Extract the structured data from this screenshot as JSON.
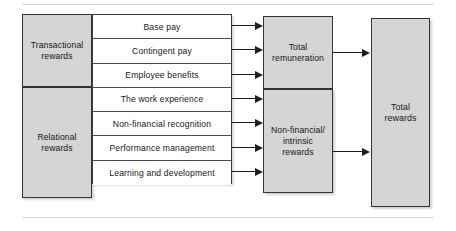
{
  "diagram": {
    "colors": {
      "box_fill": "#d5d5d5",
      "box_border": "#33333a",
      "row_fill": "#ffffff",
      "line": "#1b1b20",
      "background": "#ffffff"
    },
    "categories": [
      {
        "id": "transactional",
        "label": "Transactional\nrewards"
      },
      {
        "id": "relational",
        "label": "Relational\nrewards"
      }
    ],
    "components": [
      {
        "label": "Base pay",
        "category": "transactional",
        "feeds": "total-remuneration"
      },
      {
        "label": "Contingent pay",
        "category": "transactional",
        "feeds": "total-remuneration"
      },
      {
        "label": "Employee benefits",
        "category": "transactional",
        "feeds": "total-remuneration"
      },
      {
        "label": "The work experience",
        "category": "relational",
        "feeds": "non-financial-intrinsic-rewards"
      },
      {
        "label": "Non-financial recognition",
        "category": "relational",
        "feeds": "non-financial-intrinsic-rewards"
      },
      {
        "label": "Performance management",
        "category": "relational",
        "feeds": "non-financial-intrinsic-rewards"
      },
      {
        "label": "Learning and development",
        "category": "relational",
        "feeds": "non-financial-intrinsic-rewards"
      }
    ],
    "aggregations": [
      {
        "id": "total-remuneration",
        "label": "Total\nremuneration"
      },
      {
        "id": "non-financial-intrinsic-rewards",
        "label": "Non-financial/\nintrinsic\nrewards"
      }
    ],
    "outcome": {
      "id": "total-rewards",
      "label": "Total\nrewards"
    },
    "connectors": {
      "row_arrows": [
        {
          "from": "Base pay",
          "to": "Total remuneration"
        },
        {
          "from": "Contingent pay",
          "to": "Total remuneration"
        },
        {
          "from": "Employee benefits",
          "to": "Total remuneration"
        },
        {
          "from": "The work experience",
          "to": "Non-financial/intrinsic rewards"
        },
        {
          "from": "Non-financial recognition",
          "to": "Non-financial/intrinsic rewards"
        },
        {
          "from": "Performance management",
          "to": "Non-financial/intrinsic rewards"
        },
        {
          "from": "Learning and development",
          "to": "Non-financial/intrinsic rewards"
        }
      ],
      "outcome_arrows": [
        {
          "from": "Total remuneration",
          "to": "Total rewards"
        },
        {
          "from": "Non-financial/intrinsic rewards",
          "to": "Total rewards"
        }
      ]
    }
  }
}
